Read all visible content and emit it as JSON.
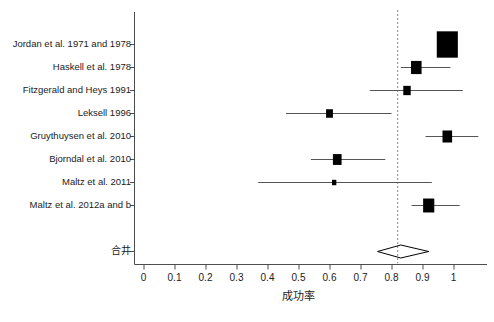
{
  "chart_data": {
    "type": "forest",
    "title": "",
    "xlabel": "成功率",
    "ylabel": "",
    "xlim": [
      -0.03,
      1.13
    ],
    "xticks": [
      0,
      0.1,
      0.2,
      0.3,
      0.4,
      0.5,
      0.6,
      0.7,
      0.8,
      0.9,
      1
    ],
    "xticklabels": [
      "0",
      "0.1",
      "0.2",
      "0.3",
      "0.4",
      "0.5",
      "0.6",
      "0.7",
      "0.8",
      "0.9",
      "1"
    ],
    "grid": false,
    "legend": "none",
    "reference_line": {
      "value": 0.82,
      "style": "dashed",
      "color": "#888888"
    },
    "studies": [
      {
        "label": "Jordan et al. 1971 and 1978",
        "estimate": 0.98,
        "ci_low": 0.96,
        "ci_high": 1.0,
        "weight_box": 0.068
      },
      {
        "label": "Haskell et al. 1978",
        "estimate": 0.88,
        "ci_low": 0.83,
        "ci_high": 0.99,
        "weight_box": 0.034
      },
      {
        "label": "Fitzgerald and Heys 1991",
        "estimate": 0.85,
        "ci_low": 0.73,
        "ci_high": 1.03,
        "weight_box": 0.024
      },
      {
        "label": "Leksell 1996",
        "estimate": 0.6,
        "ci_low": 0.46,
        "ci_high": 0.8,
        "weight_box": 0.022
      },
      {
        "label": "Gruythuysen et al. 2010",
        "estimate": 0.98,
        "ci_low": 0.91,
        "ci_high": 1.08,
        "weight_box": 0.031
      },
      {
        "label": "Bjorndal et al. 2010",
        "estimate": 0.625,
        "ci_low": 0.54,
        "ci_high": 0.78,
        "weight_box": 0.028
      },
      {
        "label": "Maltz et al. 2011",
        "estimate": 0.615,
        "ci_low": 0.37,
        "ci_high": 0.93,
        "weight_box": 0.014
      },
      {
        "label": "Maltz et al. 2012a and b",
        "estimate": 0.92,
        "ci_low": 0.865,
        "ci_high": 1.02,
        "weight_box": 0.036
      }
    ],
    "pooled": {
      "label": "合井",
      "estimate": 0.83,
      "ci_low": 0.755,
      "ci_high": 0.92,
      "marker": "diamond"
    }
  },
  "colors": {
    "marker": "#000000",
    "line": "#555555",
    "axis": "#4d4d4d",
    "reference": "#909090",
    "background": "#ffffff",
    "text": "#1b1b1b"
  }
}
